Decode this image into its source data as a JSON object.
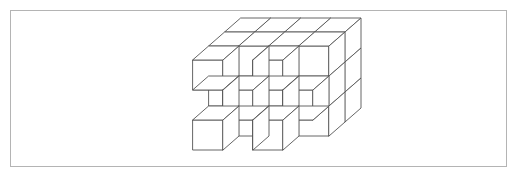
{
  "page": {
    "width": 519,
    "height": 180,
    "background_color": "#ffffff"
  },
  "frame": {
    "name": "border-frame",
    "x": 10,
    "y": 10,
    "width": 497,
    "height": 157,
    "stroke_color": "#b4b4b4",
    "stroke_width": 1,
    "fill_color": "#ffffff"
  },
  "figure": {
    "title": "",
    "caption": "",
    "type": "isometric-cube-stack",
    "stroke_color": "#555555",
    "face_fill_color": "#ffffff",
    "stroke_width": 0.9,
    "bounds": {
      "x": 185,
      "y": 28,
      "width": 150,
      "height": 130
    },
    "projection": {
      "unit_cube_width": 30,
      "unit_cube_height": 30,
      "depth_dx": 16,
      "depth_dy": -14,
      "origin_x": 193,
      "origin_y": 150
    },
    "grid": {
      "columns": 4,
      "rows": 3,
      "layers": 3
    }
  },
  "chart_data": {
    "type": "diagram",
    "title": "",
    "xlabel": "",
    "ylabel": "",
    "legend": [],
    "annotations": [],
    "occupancy_front_layer": [
      [
        1,
        0,
        1,
        0
      ],
      [
        0,
        1,
        0,
        1
      ],
      [
        1,
        0,
        1,
        0
      ]
    ],
    "occupancy_middle_layer": [
      [
        1,
        1,
        1,
        1
      ],
      [
        1,
        1,
        1,
        1
      ],
      [
        1,
        1,
        1,
        1
      ]
    ],
    "occupancy_back_layer": [
      [
        1,
        1,
        1,
        1
      ],
      [
        1,
        1,
        1,
        1
      ],
      [
        1,
        1,
        1,
        1
      ]
    ]
  }
}
